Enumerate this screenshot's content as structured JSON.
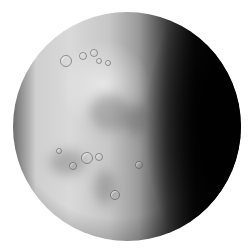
{
  "scene": {
    "subject": "grayscale moon-like planet sphere",
    "background_color": "#ffffff",
    "lit_side_color": "#d9d9d9",
    "shadow_side_color": "#050505",
    "lighting": "illuminated from the left, dark terminator on the right"
  },
  "sphere": {
    "center": [
      127,
      127
    ],
    "radius": 114
  },
  "craters": [
    {
      "x": 65,
      "y": 60,
      "r": 5
    },
    {
      "x": 82,
      "y": 55,
      "r": 3
    },
    {
      "x": 93,
      "y": 52,
      "r": 3
    },
    {
      "x": 98,
      "y": 60,
      "r": 2
    },
    {
      "x": 107,
      "y": 62,
      "r": 2
    },
    {
      "x": 86,
      "y": 157,
      "r": 5
    },
    {
      "x": 98,
      "y": 156,
      "r": 3
    },
    {
      "x": 72,
      "y": 165,
      "r": 3
    },
    {
      "x": 114,
      "y": 194,
      "r": 4
    },
    {
      "x": 138,
      "y": 164,
      "r": 3
    },
    {
      "x": 58,
      "y": 150,
      "r": 2
    }
  ],
  "maria": [
    {
      "x": 90,
      "y": 95,
      "w": 40,
      "h": 35
    },
    {
      "x": 50,
      "y": 150,
      "w": 35,
      "h": 25
    },
    {
      "x": 95,
      "y": 170,
      "w": 20,
      "h": 35
    },
    {
      "x": 125,
      "y": 105,
      "w": 25,
      "h": 30
    }
  ]
}
